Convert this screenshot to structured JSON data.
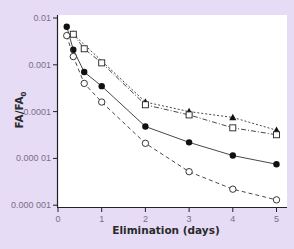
{
  "chart_data": {
    "type": "line",
    "title": "",
    "xlabel": "Elimination (days)",
    "ylabel": "FA/FA0",
    "ylabel_main": "FA/FA",
    "ylabel_sub": "0",
    "yscale": "log",
    "xlim": [
      0,
      5.2
    ],
    "ylim": [
      1e-06,
      0.01
    ],
    "x_ticks": [
      0,
      1,
      2,
      3,
      4,
      5
    ],
    "x_tick_labels": [
      "0",
      "1",
      "2",
      "3",
      "4",
      "5"
    ],
    "y_ticks": [
      0.01,
      0.001,
      0.0001,
      1e-05,
      1e-06
    ],
    "y_tick_labels": [
      "0.01",
      "0.001",
      "0.0001",
      "0.000 01",
      "0.000 001"
    ],
    "grid": false,
    "legend": "none",
    "series": [
      {
        "name": "filled triangles",
        "marker": "triangle-filled",
        "line": "dotted",
        "x": [
          0.35,
          2,
          3,
          4,
          5
        ],
        "values": [
          0.0045,
          0.00016,
          0.0001,
          7.5e-05,
          4e-05
        ]
      },
      {
        "name": "open squares",
        "marker": "square-open",
        "line": "dash-dot",
        "x": [
          0.35,
          0.6,
          1,
          2,
          3,
          4,
          5
        ],
        "values": [
          0.0045,
          0.0022,
          0.0011,
          0.00014,
          8.5e-05,
          4.5e-05,
          3.2e-05
        ]
      },
      {
        "name": "filled circles",
        "marker": "circle-filled",
        "line": "solid",
        "x": [
          0.2,
          0.35,
          0.6,
          1,
          2,
          3,
          4,
          5
        ],
        "values": [
          0.0065,
          0.0021,
          0.0007,
          0.00035,
          4.8e-05,
          2.2e-05,
          1.15e-05,
          7.5e-06
        ]
      },
      {
        "name": "open circles",
        "marker": "circle-open",
        "line": "dashed",
        "x": [
          0.2,
          0.35,
          0.6,
          1,
          2,
          3,
          4,
          5
        ],
        "values": [
          0.0042,
          0.0015,
          0.0004,
          0.00016,
          2.1e-05,
          5.2e-06,
          2.2e-06,
          1.3e-06
        ]
      }
    ]
  }
}
